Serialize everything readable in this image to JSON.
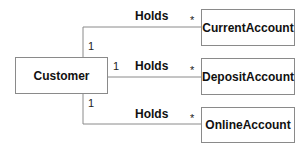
{
  "diagram": {
    "type": "UML class diagram",
    "source_class": {
      "name": "Customer"
    },
    "target_classes": [
      {
        "name": "CurrentAccount"
      },
      {
        "name": "DepositAccount"
      },
      {
        "name": "OnlineAccount"
      }
    ],
    "associations": [
      {
        "from": "Customer",
        "to": "CurrentAccount",
        "label": "Holds",
        "source_multiplicity": "1",
        "target_multiplicity": "*"
      },
      {
        "from": "Customer",
        "to": "DepositAccount",
        "label": "Holds",
        "source_multiplicity": "1",
        "target_multiplicity": "*"
      },
      {
        "from": "Customer",
        "to": "OnlineAccount",
        "label": "Holds",
        "source_multiplicity": "1",
        "target_multiplicity": "*"
      }
    ],
    "colors": {
      "line": "#8a8a8a",
      "text": "#111111",
      "background": "#ffffff"
    }
  }
}
